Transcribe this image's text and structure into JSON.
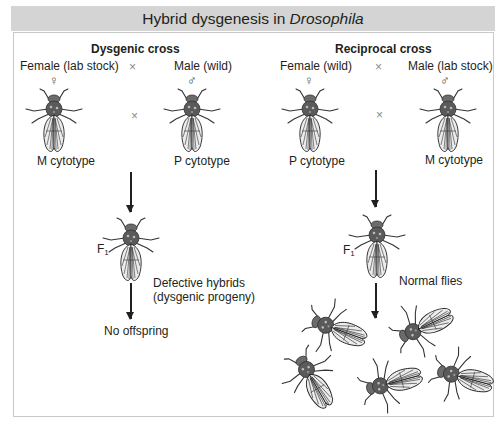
{
  "title": {
    "prefix": "Hybrid dysgenesis in ",
    "italic": "Drosophila"
  },
  "dysgenic": {
    "heading": "Dysgenic cross",
    "female_label": "Female (lab stock)",
    "male_label": "Male (wild)",
    "cross_symbol": "×",
    "female_symbol": "♀",
    "male_symbol": "♂",
    "female_cytotype": "M cytotype",
    "male_cytotype": "P cytotype",
    "f1_label": "F",
    "f1_sub": "1",
    "progeny_line1": "Defective hybrids",
    "progeny_line2": "(dysgenic progeny)",
    "outcome": "No offspring"
  },
  "reciprocal": {
    "heading": "Reciprocal cross",
    "female_label": "Female (wild)",
    "male_label": "Male (lab stock)",
    "cross_symbol": "×",
    "female_symbol": "♀",
    "male_symbol": "♂",
    "female_cytotype": "P cytotype",
    "male_cytotype": "M cytotype",
    "f1_label": "F",
    "f1_sub": "1",
    "progeny_label": "Normal flies",
    "offspring_count": 5
  },
  "colors": {
    "header_bg": "#d4d4d4",
    "panel_border": "#c9c9c9",
    "ink": "#231f20"
  }
}
